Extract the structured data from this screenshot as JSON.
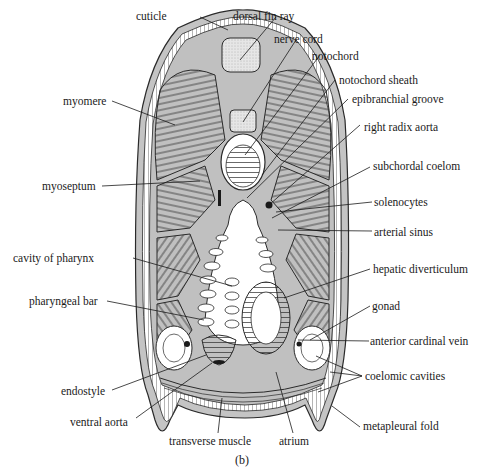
{
  "figure": {
    "caption": "(b)",
    "colors": {
      "line": "#2a2a2a",
      "tissue_gray": "#b8b8b8",
      "stipple": "#d6d6d6",
      "background": "#ffffff"
    }
  },
  "labels": {
    "cuticle": "cuticle",
    "dorsal_fin_ray": "dorsal fin ray",
    "nerve_cord": "nerve cord",
    "notochord": "notochord",
    "notochord_sheath": "notochord sheath",
    "epibranchial_groove": "epibranchial groove",
    "right_radix_aorta": "right radix aorta",
    "subchordal_coelom": "subchordal coelom",
    "solenocytes": "solenocytes",
    "arterial_sinus": "arterial sinus",
    "hepatic_diverticulum": "hepatic diverticulum",
    "gonad": "gonad",
    "anterior_cardinal_vein": "anterior cardinal vein",
    "coelomic_cavities": "coelomic cavities",
    "metapleural_fold": "metapleural fold",
    "atrium": "atrium",
    "transverse_muscle": "transverse muscle",
    "ventral_aorta": "ventral aorta",
    "endostyle": "endostyle",
    "pharyngeal_bar": "pharyngeal bar",
    "cavity_of_pharynx": "cavity of pharynx",
    "myoseptum": "myoseptum",
    "myomere": "myomere"
  }
}
